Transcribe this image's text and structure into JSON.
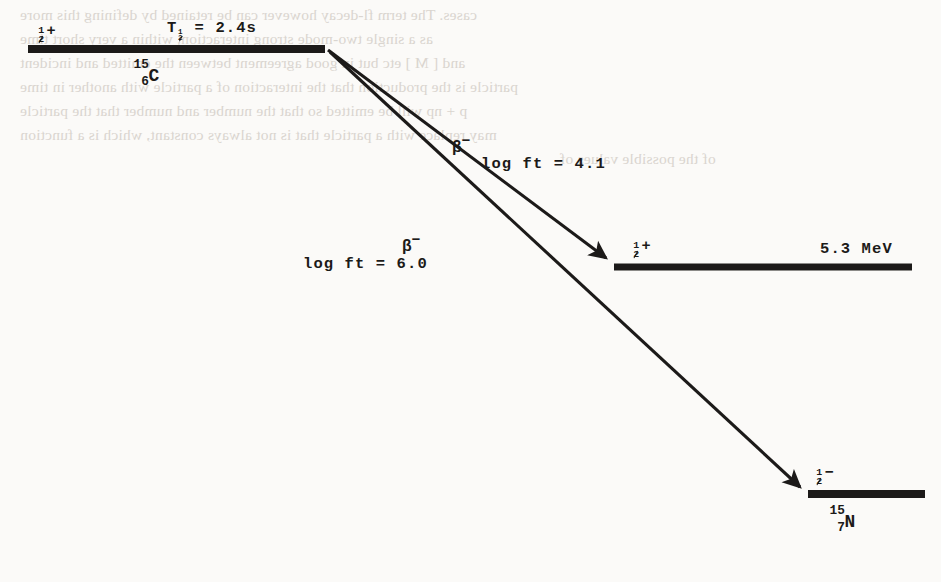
{
  "diagram": {
    "type": "nuclear-decay-scheme",
    "parent": {
      "spin_parity": "+",
      "spin_value": "1/2",
      "half_life_symbol": "T",
      "half_life_subscript": "1/2",
      "half_life_equals": "=",
      "half_life_value": "2.4s",
      "half_life_text": "T1/2 = 2.4s",
      "mass_number": "15",
      "atomic_number": "6",
      "element": "C",
      "nuclide_text": "15-6-C"
    },
    "transitions": [
      {
        "name": "beta-minus-to-excited",
        "particle": "β",
        "particle_charge": "−",
        "logft_label": "log ft = 4.1",
        "logft_value": "4.1"
      },
      {
        "name": "beta-minus-to-ground",
        "particle": "β",
        "particle_charge": "−",
        "logft_label": "log ft = 6.0",
        "logft_value": "6.0"
      }
    ],
    "daughter_excited": {
      "spin_parity": "+",
      "spin_value": "1/2",
      "energy": "5.3 MeV"
    },
    "daughter_ground": {
      "spin_parity": "−",
      "spin_value": "1/2",
      "mass_number": "15",
      "atomic_number": "7",
      "element": "N",
      "nuclide_text": "15-7-N"
    },
    "colors": {
      "ink": "#1c1a19",
      "paper": "#fbfaf8",
      "bleed": "#cfc9c2"
    }
  },
  "bleedthrough": {
    "line1": "cases.  The term fl-decay however can be retained by defining this more",
    "line2": "as a single two-mode strong interaction, within a very short time",
    "line3": "and  [ M ] etc but in good agreement between the emitted and incident",
    "line4": "particle is the production that  the interaction of a particle with another in time",
    "line5": "p + np will be emitted so that the number and number that the particle",
    "line6": "may replace with a particle that is not always constant, which is a  function",
    "line7": "of the possible values of"
  }
}
